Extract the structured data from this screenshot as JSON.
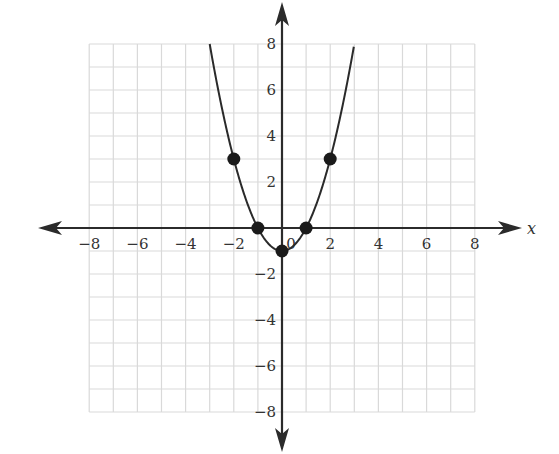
{
  "chart_data": {
    "type": "line",
    "title": "",
    "xlabel": "x",
    "ylabel": "",
    "xlim": [
      -8,
      8
    ],
    "ylim": [
      -8,
      8
    ],
    "grid": true,
    "x_ticks": [
      -8,
      -6,
      -4,
      -2,
      0,
      2,
      4,
      6,
      8
    ],
    "x_tick_labels": [
      "−8",
      "−6",
      "−4",
      "−2",
      "0",
      "2",
      "4",
      "6",
      "8"
    ],
    "y_ticks": [
      8,
      6,
      4,
      2,
      -2,
      -4,
      -6,
      -8
    ],
    "y_tick_labels": [
      "8",
      "6",
      "4",
      "2",
      "−2",
      "−4",
      "−6",
      "−8"
    ],
    "series": [
      {
        "name": "y = x^2 - 1",
        "kind": "curve",
        "function": "x^2 - 1",
        "domain": [
          -3,
          3
        ],
        "color": "#2a2a2a"
      },
      {
        "name": "plotted points",
        "kind": "scatter",
        "x": [
          -2,
          -1,
          0,
          1,
          2
        ],
        "y": [
          3,
          0,
          -1,
          0,
          3
        ],
        "color": "#1a1a1a"
      }
    ],
    "legend": null
  },
  "colors": {
    "grid": "#d9d9d9",
    "axis": "#2b2b2b",
    "curve": "#2a2a2a",
    "point": "#1a1a1a",
    "label": "#333333"
  }
}
